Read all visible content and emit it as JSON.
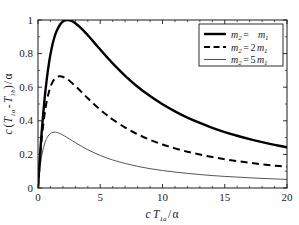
{
  "chart_data": {
    "type": "line",
    "title": "",
    "xlabel": "c T_1a / α",
    "ylabel": "c ( T_1a - T_1b ) / α",
    "xlim": [
      0,
      20
    ],
    "ylim": [
      0,
      1
    ],
    "xticks": [
      "0",
      "5",
      "10",
      "15",
      "20"
    ],
    "xtick_values": [
      0,
      5,
      10,
      15,
      20
    ],
    "yticks": [
      "0",
      "0.2",
      "0.4",
      "0.6",
      "0.8",
      "1"
    ],
    "ytick_values": [
      0,
      0.2,
      0.4,
      0.6,
      0.8,
      1
    ],
    "grid": false,
    "legend_position": "upper right",
    "series": [
      {
        "name": "m_2 = m_1",
        "style": "solid-thick",
        "color": "#000000",
        "width": 2.4,
        "peak_x": 2.4,
        "peak_y": 1.0,
        "x": [
          0,
          0.1,
          0.2,
          0.3,
          0.5,
          0.7,
          0.9,
          1.1,
          1.3,
          1.5,
          1.8,
          2.1,
          2.4,
          2.7,
          3.0,
          3.5,
          4.0,
          4.5,
          5.0,
          5.5,
          6.0,
          7.0,
          8.0,
          9.0,
          10.0,
          11.0,
          12.0,
          13.0,
          14.0,
          15.0,
          16.0,
          17.0,
          18.0,
          19.0,
          20.0
        ],
        "y": [
          0,
          0.122,
          0.235,
          0.337,
          0.508,
          0.645,
          0.752,
          0.833,
          0.893,
          0.934,
          0.976,
          0.996,
          1.0,
          0.994,
          0.981,
          0.949,
          0.909,
          0.867,
          0.824,
          0.782,
          0.742,
          0.668,
          0.603,
          0.547,
          0.498,
          0.456,
          0.419,
          0.387,
          0.358,
          0.333,
          0.311,
          0.291,
          0.273,
          0.257,
          0.242
        ]
      },
      {
        "name": "m_2 = 2 m_1",
        "style": "dashed",
        "color": "#000000",
        "width": 2.0,
        "peak_x": 1.7,
        "peak_y": 0.665,
        "x": [
          0,
          0.1,
          0.2,
          0.3,
          0.5,
          0.7,
          0.9,
          1.1,
          1.3,
          1.5,
          1.7,
          1.9,
          2.2,
          2.5,
          3.0,
          3.5,
          4.0,
          4.5,
          5.0,
          5.5,
          6.0,
          7.0,
          8.0,
          9.0,
          10.0,
          11.0,
          12.0,
          13.0,
          14.0,
          15.0,
          16.0,
          17.0,
          18.0,
          19.0,
          20.0
        ],
        "y": [
          0,
          0.112,
          0.21,
          0.295,
          0.425,
          0.516,
          0.578,
          0.62,
          0.646,
          0.66,
          0.665,
          0.664,
          0.655,
          0.64,
          0.607,
          0.571,
          0.534,
          0.499,
          0.466,
          0.436,
          0.408,
          0.36,
          0.32,
          0.287,
          0.259,
          0.236,
          0.216,
          0.199,
          0.184,
          0.171,
          0.16,
          0.15,
          0.141,
          0.133,
          0.126
        ]
      },
      {
        "name": "m_2 = 5 m_1",
        "style": "solid-thin",
        "color": "#555555",
        "width": 1.0,
        "peak_x": 1.3,
        "peak_y": 0.332,
        "x": [
          0,
          0.1,
          0.2,
          0.3,
          0.5,
          0.7,
          0.9,
          1.1,
          1.3,
          1.5,
          1.8,
          2.1,
          2.5,
          3.0,
          3.5,
          4.0,
          4.5,
          5.0,
          5.5,
          6.0,
          7.0,
          8.0,
          9.0,
          10.0,
          11.0,
          12.0,
          13.0,
          14.0,
          15.0,
          16.0,
          17.0,
          18.0,
          19.0,
          20.0
        ],
        "y": [
          0,
          0.079,
          0.142,
          0.192,
          0.256,
          0.295,
          0.318,
          0.329,
          0.332,
          0.331,
          0.323,
          0.311,
          0.293,
          0.27,
          0.248,
          0.228,
          0.21,
          0.194,
          0.179,
          0.167,
          0.146,
          0.129,
          0.115,
          0.104,
          0.095,
          0.087,
          0.08,
          0.074,
          0.069,
          0.065,
          0.061,
          0.057,
          0.054,
          0.051
        ]
      }
    ]
  },
  "legend": {
    "entries": [
      {
        "lhs": "m",
        "lhs_sub": "2",
        "eq": "=",
        "coef": "",
        "rhs": "m",
        "rhs_sub": "1"
      },
      {
        "lhs": "m",
        "lhs_sub": "2",
        "eq": "=",
        "coef": "2",
        "rhs": "m",
        "rhs_sub": "1"
      },
      {
        "lhs": "m",
        "lhs_sub": "2",
        "eq": "=",
        "coef": "5",
        "rhs": "m",
        "rhs_sub": "1"
      }
    ]
  },
  "axes": {
    "x_title_parts": {
      "c": "c",
      "T": "T",
      "T_sub": "1a",
      "slash": "/",
      "alpha": "α"
    },
    "y_title_parts": {
      "c": "c",
      "open": "(",
      "T1": "T",
      "T1_sub": "1a",
      "minus": "-",
      "T2": "T",
      "T2_sub": "1b",
      "close": ")",
      "slash": "/",
      "alpha": "α"
    }
  },
  "colors": {
    "background": "#ffffff",
    "axis": "#1a1a1a",
    "series_primary": "#000000",
    "series_tertiary": "#555555"
  }
}
